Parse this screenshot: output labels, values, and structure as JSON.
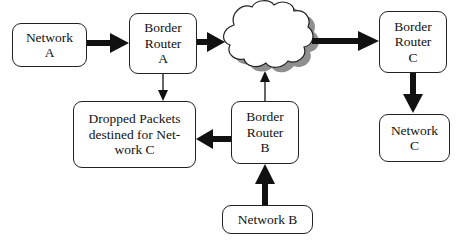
{
  "diagram": {
    "nodes": {
      "network_a": {
        "label": "Network\nA"
      },
      "border_router_a": {
        "label": "Border\nRouter\nA"
      },
      "internet_cloud": {
        "label": ""
      },
      "border_router_c": {
        "label": "Border\nRouter\nC"
      },
      "network_c": {
        "label": "Network\nC"
      },
      "dropped_packets": {
        "label": "Dropped Packets\ndestined for Net-\nwork C"
      },
      "border_router_b": {
        "label": "Border\nRouter\nB"
      },
      "network_b": {
        "label": "Network B"
      }
    },
    "edges": [
      {
        "from": "Network A",
        "to": "Border Router A",
        "style": "thick"
      },
      {
        "from": "Border Router A",
        "to": "Cloud",
        "style": "thick"
      },
      {
        "from": "Border Router A",
        "to": "Dropped Packets",
        "style": "thin"
      },
      {
        "from": "Cloud",
        "to": "Border Router C",
        "style": "thick"
      },
      {
        "from": "Border Router C",
        "to": "Network C",
        "style": "thick"
      },
      {
        "from": "Border Router B",
        "to": "Dropped Packets",
        "style": "thick"
      },
      {
        "from": "Border Router B",
        "to": "Cloud",
        "style": "thin"
      },
      {
        "from": "Network B",
        "to": "Border Router B",
        "style": "thick"
      }
    ],
    "colors": {
      "line": "#111111",
      "cloud_shadow": "#8a8a8a",
      "box_border": "#222222"
    }
  }
}
